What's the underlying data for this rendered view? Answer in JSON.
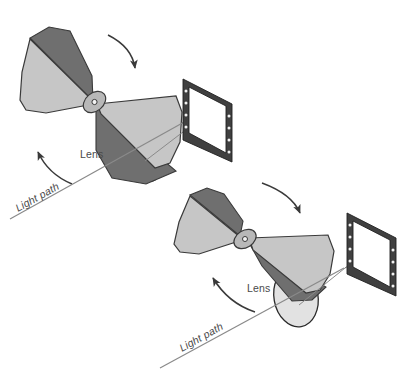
{
  "figure": {
    "background_color": "#ffffff"
  },
  "palette": {
    "blade_light": "#c6c6c6",
    "blade_dark": "#6f6f6f",
    "blade_mid": "#9a9a9a",
    "hub": "#b0b0b0",
    "outline": "#3a3a3a",
    "frame_dark": "#404040",
    "frame_hole": "#f2f2f2",
    "label_text": "#4a4a4a",
    "leader_line": "#8a8a8a",
    "arrow": "#3a3a3a",
    "lens_open": "#e2e2e2"
  },
  "assemblies": [
    {
      "id": "assembly-closed",
      "position_label": "closed",
      "lens_label": "Lens",
      "light_path_label": "Light path",
      "rotation_arrow_top": "curved-arrow-down-right",
      "rotation_arrow_left": "curved-arrow-up-left",
      "frame_screw_count": 8
    },
    {
      "id": "assembly-open",
      "position_label": "open",
      "lens_label": "Lens",
      "light_path_label": "Light path",
      "rotation_arrow_top": "curved-arrow-down-right",
      "rotation_arrow_left": "curved-arrow-up-left",
      "frame_screw_count": 8
    }
  ],
  "labels": {
    "lens_top": "Lens",
    "light_path_top": "Light path",
    "lens_bottom": "Lens",
    "light_path_bottom": "Light path"
  }
}
